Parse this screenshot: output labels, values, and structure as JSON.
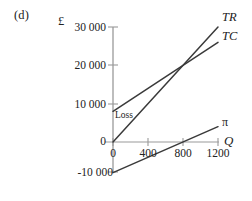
{
  "figure": {
    "panel_label": "(d)",
    "y_unit_label": "£",
    "x_axis_label": "Q",
    "annotation_loss": "Loss"
  },
  "chart_data": {
    "type": "line",
    "title": "",
    "subtitle": "",
    "xlabel": "Q",
    "ylabel": "£",
    "xlim": [
      0,
      1300
    ],
    "ylim": [
      -10000,
      30000
    ],
    "grid": false,
    "legend_position": "right-of-line-ends",
    "xticks": [
      0,
      400,
      800,
      1200
    ],
    "xtick_labels": [
      "0",
      "400",
      "800",
      "1200"
    ],
    "yticks": [
      -10000,
      0,
      10000,
      20000,
      30000
    ],
    "ytick_labels": [
      "-10 000",
      "0",
      "10 000",
      "20 000",
      "30 000"
    ],
    "annotations": [
      {
        "text": "Loss",
        "x": 60,
        "y": 7000
      }
    ],
    "series": [
      {
        "name": "TR",
        "label": "TR",
        "color": "#3a3a3a",
        "x": [
          0,
          1200
        ],
        "values": [
          0,
          30000
        ]
      },
      {
        "name": "TC",
        "label": "TC",
        "color": "#3a3a3a",
        "x": [
          0,
          1200
        ],
        "values": [
          8000,
          26000
        ]
      },
      {
        "name": "pi",
        "label": "π",
        "color": "#3a3a3a",
        "x": [
          0,
          1200
        ],
        "values": [
          -8000,
          4000
        ]
      }
    ],
    "breakeven": {
      "x": 800,
      "y": 20000
    }
  },
  "style": {
    "axis_color": "#9a9a9a",
    "line_color": "#3a3a3a",
    "text_color": "#222222",
    "background": "#ffffff"
  }
}
